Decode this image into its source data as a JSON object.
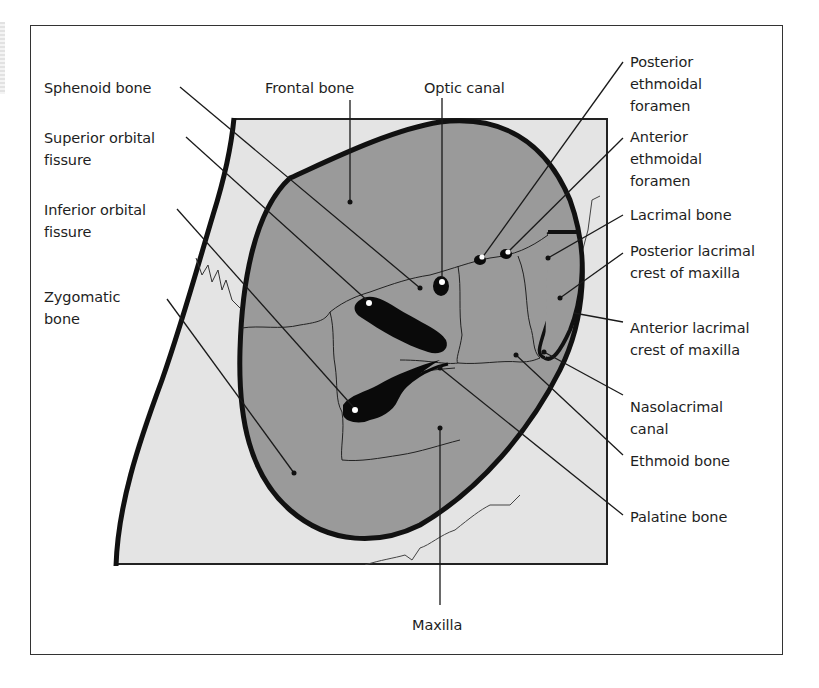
{
  "diagram": {
    "colors": {
      "background": "#ffffff",
      "outer_region": "#e4e4e4",
      "orbit_region": "#9a9a9a",
      "outline": "#111111",
      "frame": "#333333",
      "text": "#1e1e1e"
    },
    "labels": {
      "sphenoid_bone": "Sphenoid bone",
      "frontal_bone": "Frontal bone",
      "optic_canal": "Optic canal",
      "superior_orbital_fissure": "Superior orbital\nfissure",
      "inferior_orbital_fissure": "Inferior orbital\nfissure",
      "zygomatic_bone": "Zygomatic\nbone",
      "posterior_ethmoidal_foramen": "Posterior\nethmoidal\nforamen",
      "anterior_ethmoidal_foramen": "Anterior\nethmoidal\nforamen",
      "lacrimal_bone": "Lacrimal bone",
      "posterior_lacrimal_crest": "Posterior lacrimal\ncrest of maxilla",
      "anterior_lacrimal_crest": "Anterior lacrimal\ncrest of maxilla",
      "nasolacrimal_canal": "Nasolacrimal\ncanal",
      "ethmoid_bone": "Ethmoid bone",
      "palatine_bone": "Palatine bone",
      "maxilla": "Maxilla"
    }
  }
}
